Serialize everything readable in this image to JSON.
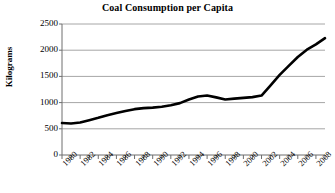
{
  "chart_data": {
    "type": "line",
    "title": "Coal Consumption per Capita",
    "xlabel": "",
    "ylabel": "Kilograms",
    "ylim": [
      0,
      2500
    ],
    "ytick_values": [
      0,
      500,
      1000,
      1500,
      2000,
      2500
    ],
    "ytick_labels": [
      "0",
      "500",
      "1000",
      "1500",
      "2000",
      "2500"
    ],
    "grid": true,
    "legend": false,
    "xlim": [
      1980,
      2009
    ],
    "xtick_labels": [
      "1980",
      "1982",
      "1984",
      "1986",
      "1988",
      "1990",
      "1992",
      "1994",
      "1996",
      "1998",
      "2000",
      "2002",
      "2004",
      "2006",
      "2008"
    ],
    "x": [
      1980,
      1981,
      1982,
      1983,
      1984,
      1985,
      1986,
      1987,
      1988,
      1989,
      1990,
      1991,
      1992,
      1993,
      1994,
      1995,
      1996,
      1997,
      1998,
      1999,
      2000,
      2001,
      2002,
      2003,
      2004,
      2005,
      2006,
      2007,
      2008,
      2009
    ],
    "values": [
      610,
      600,
      620,
      665,
      710,
      760,
      800,
      840,
      875,
      895,
      905,
      920,
      950,
      990,
      1060,
      1115,
      1135,
      1100,
      1060,
      1075,
      1090,
      1105,
      1135,
      1330,
      1530,
      1700,
      1870,
      2010,
      2110,
      2230
    ],
    "series_name": "Coal consumption per capita",
    "line_color": "#000000",
    "grid_color": "#a6a6a6",
    "units": "kilograms"
  }
}
